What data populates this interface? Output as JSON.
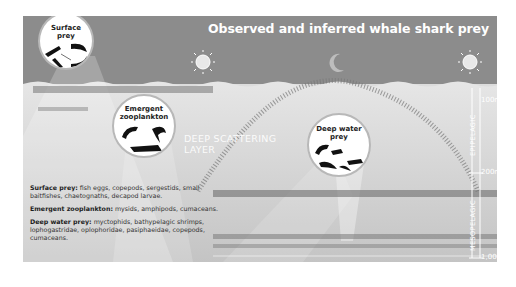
{
  "figure": {
    "title": "Observed and inferred whale shark prey",
    "colors": {
      "sky": "#8c8c8c",
      "sea": "#dcdcdc",
      "bubble": "#ffffff",
      "label_text": "#ffffff",
      "body_text": "#333333"
    },
    "sky_icons": [
      {
        "name": "sun-icon",
        "position": "left"
      },
      {
        "name": "moon-icon",
        "position": "center"
      },
      {
        "name": "sun-icon",
        "position": "right"
      }
    ],
    "bubbles": [
      {
        "label_line1": "Surface",
        "label_line2": "prey"
      },
      {
        "label_line1": "Emergent",
        "label_line2": "zooplankton"
      },
      {
        "label_line1": "Deep water",
        "label_line2": "prey"
      }
    ],
    "layer_label": {
      "line1": "DEEP SCATTERING",
      "line2": "LAYER"
    },
    "depth_scale": {
      "marks": [
        "100m",
        "200m",
        "1,000"
      ],
      "zones": [
        "EPIPELAGIC",
        "MESOPELAGIC"
      ]
    },
    "legend": [
      {
        "term": "Surface prey:",
        "desc": "fish eggs, copepods, sergestids, small baitfishes, chaetognaths, decapod larvae."
      },
      {
        "term": "Emergent zooplankton:",
        "desc": "mysids, amphipods, cumaceans."
      },
      {
        "term": "Deep water prey:",
        "desc": "myctophids, bathypelagic shrimps, lophogastridae, oplophoridae, pasiphaeidae, copepods, cumaceans."
      }
    ]
  }
}
